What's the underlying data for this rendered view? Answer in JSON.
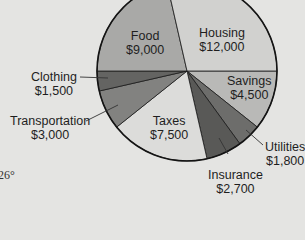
{
  "chart_data": {
    "type": "pie",
    "title": "",
    "total": 42000,
    "slices": [
      {
        "label": "Savings",
        "value": 4500,
        "display": "$4,500",
        "color": "#b9b9b7"
      },
      {
        "label": "Utilities",
        "value": 1800,
        "display": "$1,800",
        "color": "#6d6d6b"
      },
      {
        "label": "Insurance",
        "value": 2700,
        "display": "$2,700",
        "color": "#595957"
      },
      {
        "label": "Taxes",
        "value": 7500,
        "display": "$7,500",
        "color": "#dcdcda"
      },
      {
        "label": "Transportation",
        "value": 3000,
        "display": "$3,000",
        "color": "#828280"
      },
      {
        "label": "Clothing",
        "value": 1500,
        "display": "$1,500",
        "color": "#646462"
      },
      {
        "label": "Food",
        "value": 9000,
        "display": "$9,000",
        "color": "#a9a9a7"
      },
      {
        "label": "Housing",
        "value": 12000,
        "display": "$12,000",
        "color": "#d1d1cf"
      }
    ],
    "start_angle_deg": 0,
    "direction": "clockwise"
  },
  "labels": {
    "food": {
      "name": "Food",
      "amount": "$9,000"
    },
    "housing": {
      "name": "Housing",
      "amount": "$12,000"
    },
    "savings": {
      "name": "Savings",
      "amount": "$4,500"
    },
    "clothing": {
      "name": "Clothing",
      "amount": "$1,500"
    },
    "transportation": {
      "name": "Transportation",
      "amount": "$3,000"
    },
    "taxes": {
      "name": "Taxes",
      "amount": "$7,500"
    },
    "utilities": {
      "name": "Utilities",
      "amount": "$1,800"
    },
    "insurance": {
      "name": "Insurance",
      "amount": "$2,700"
    }
  },
  "margin_text": "26°"
}
